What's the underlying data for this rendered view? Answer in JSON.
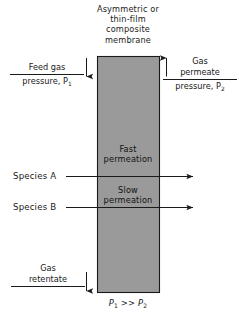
{
  "diagram": {
    "title_lines": [
      "Asymmetric or",
      "thin-film",
      "composite",
      "membrane"
    ],
    "membrane": {
      "fill_color": "#9a9a9a",
      "stroke_color": "#1a1a1a"
    },
    "feed": {
      "name": "Feed gas",
      "pressure": "pressure, P",
      "pressure_subscript": "1",
      "arrow": "down-arrow"
    },
    "permeate": {
      "name": "Gas",
      "name_line2": "permeate",
      "pressure": "pressure, P",
      "pressure_subscript": "2",
      "arrow": "up-arrow"
    },
    "retentate": {
      "name": "Gas",
      "name_line2": "retentate",
      "arrow": "down-arrow"
    },
    "permeation": {
      "fast": [
        "Fast",
        "permeation"
      ],
      "slow": [
        "Slow",
        "permeation"
      ]
    },
    "species": [
      {
        "label": "Species A",
        "permeation": "Fast permeation"
      },
      {
        "label": "Species B",
        "permeation": "Slow permeation"
      }
    ],
    "pressure_relation": {
      "left": "P",
      "left_sub": "1",
      "operator": ">>",
      "right": "P",
      "right_sub": "2"
    }
  }
}
